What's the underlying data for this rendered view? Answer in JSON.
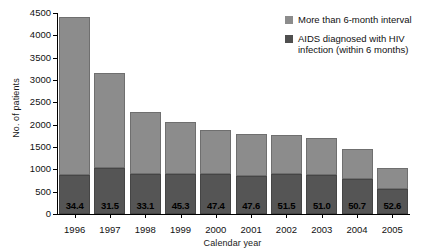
{
  "chart_data": {
    "type": "bar",
    "title": "",
    "subtitle": "",
    "xlabel": "Calendar year",
    "ylabel": "No. of patients",
    "categories": [
      "1996",
      "1997",
      "1998",
      "1999",
      "2000",
      "2001",
      "2002",
      "2003",
      "2004",
      "2005"
    ],
    "ylim": [
      0,
      4500
    ],
    "yticks": [
      0,
      500,
      1000,
      1500,
      2000,
      2500,
      3000,
      3500,
      4000,
      4500
    ],
    "ytick_labels": [
      "0",
      "500",
      "1000",
      "1500",
      "2000",
      "2500",
      "3000",
      "3500",
      "4000",
      "4500"
    ],
    "grid": false,
    "stacked": true,
    "legend_position": "top-right",
    "series": [
      {
        "name": "AIDS diagnosed with HIV infection (within 6 months)",
        "color": "#555555",
        "values": [
          870,
          1020,
          890,
          900,
          890,
          860,
          900,
          870,
          780,
          560
        ]
      },
      {
        "name": "More than 6-month interval",
        "color": "#8c8c8c",
        "values": [
          3550,
          2140,
          1400,
          1150,
          990,
          940,
          880,
          830,
          680,
          480
        ]
      }
    ],
    "totals": [
      4420,
      3160,
      2290,
      2050,
      1880,
      1800,
      1780,
      1700,
      1460,
      1040
    ],
    "data_labels": [
      "34.4",
      "31.5",
      "33.1",
      "45.3",
      "47.4",
      "47.6",
      "51.5",
      "51.0",
      "50.7",
      "52.6"
    ],
    "data_label_note": "percentage of total diagnosed with HIV infection within 6 months"
  },
  "legend": {
    "items": [
      {
        "label": "More than 6-month interval",
        "color": "#8c8c8c",
        "swatch": "legend-swatch-light"
      },
      {
        "label": "AIDS diagnosed with HIV infection (within 6 months)",
        "color": "#4f4f4f",
        "swatch": "legend-swatch-dark"
      }
    ]
  }
}
